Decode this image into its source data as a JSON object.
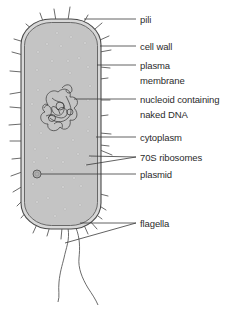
{
  "diagram": {
    "colors": {
      "cytoplasm": "#c4c4c4",
      "cell_wall": "#d8d8d8",
      "outline": "#4a4a4a",
      "leader_line": "#3a3a3a",
      "ribosome": "#f2f2f2",
      "text": "#2b2b2b"
    },
    "labels": [
      {
        "id": "pili",
        "lines": [
          "pili"
        ],
        "y": 13
      },
      {
        "id": "cell-wall",
        "lines": [
          "cell wall"
        ],
        "y": 40
      },
      {
        "id": "plasma-membrane",
        "lines": [
          "plasma",
          "membrane"
        ],
        "y": 59
      },
      {
        "id": "nucleoid",
        "lines": [
          "nucleoid containing",
          "naked DNA"
        ],
        "y": 93
      },
      {
        "id": "cytoplasm",
        "lines": [
          "cytoplasm"
        ],
        "y": 131
      },
      {
        "id": "ribosomes",
        "lines": [
          "70S ribosomes"
        ],
        "y": 151
      },
      {
        "id": "plasmid",
        "lines": [
          "plasmid"
        ],
        "y": 168
      },
      {
        "id": "flagella",
        "lines": [
          "flagella"
        ],
        "y": 217
      }
    ]
  }
}
